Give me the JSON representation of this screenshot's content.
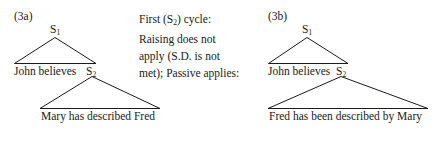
{
  "figure": {
    "kind": "syntax-tree-derivation",
    "panels": [
      {
        "tag": "(3a)",
        "top_node": "S",
        "top_node_sub": "1",
        "embedded_clause_prefix": "John believes",
        "embedded_node": "S",
        "embedded_node_sub": "2",
        "terminal_string": "Mary has described Fred"
      },
      {
        "tag": "(3b)",
        "top_node": "S",
        "top_node_sub": "1",
        "embedded_clause_prefix": "John believes",
        "embedded_node": "S",
        "embedded_node_sub": "2",
        "terminal_string": "Fred has been described by Mary"
      }
    ]
  },
  "annotation": {
    "lines": [
      {
        "pre": "First (S",
        "sub": "2",
        "post": ") cycle:"
      },
      {
        "pre": "Raising does not",
        "sub": "",
        "post": ""
      },
      {
        "pre": "apply (S.D. is not",
        "sub": "",
        "post": ""
      },
      {
        "pre": "met); Passive applies:",
        "sub": "",
        "post": ""
      }
    ]
  },
  "colors": {
    "ink": "#1a1a1a",
    "stroke": "#1b1b1b",
    "page": "#ffffff"
  }
}
